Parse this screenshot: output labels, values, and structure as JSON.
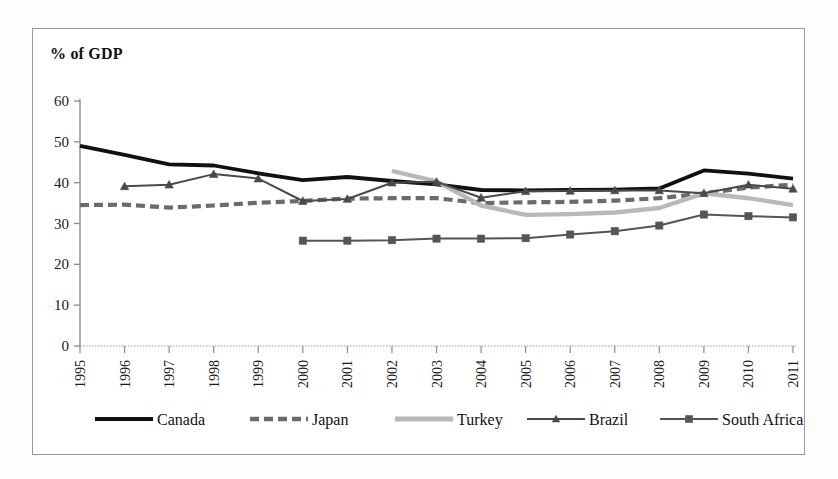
{
  "chart_data": {
    "type": "line",
    "title": "% of GDP",
    "ylabel": "% of GDP",
    "xlabel": "",
    "ylim": [
      0,
      60
    ],
    "ytick_step": 10,
    "grid": false,
    "legend_position": "bottom",
    "yticks": [
      "0",
      "10",
      "20",
      "30",
      "40",
      "50",
      "60"
    ],
    "categories": [
      "1995",
      "1996",
      "1997",
      "1998",
      "1999",
      "2000",
      "2001",
      "2002",
      "2003",
      "2004",
      "2005",
      "2006",
      "2007",
      "2008",
      "2009",
      "2010",
      "2011"
    ],
    "series": [
      {
        "name": "Canada",
        "color": "#111111",
        "style": "solid-thick",
        "marker": "none",
        "values": [
          49.0,
          46.8,
          44.5,
          44.2,
          42.3,
          40.6,
          41.4,
          40.4,
          39.6,
          38.2,
          38.1,
          38.2,
          38.3,
          38.6,
          43.0,
          42.2,
          41.0
        ]
      },
      {
        "name": "Japan",
        "color": "#6b6b6b",
        "style": "dashed-thick",
        "marker": "none",
        "values": [
          34.5,
          34.6,
          33.9,
          34.4,
          35.1,
          35.5,
          36.1,
          36.2,
          36.2,
          35.0,
          35.2,
          35.3,
          35.6,
          36.2,
          37.4,
          38.8,
          39.5
        ]
      },
      {
        "name": "Turkey",
        "color": "#b9b9b9",
        "style": "solid-thick",
        "marker": "none",
        "values": [
          null,
          null,
          null,
          null,
          null,
          null,
          null,
          42.9,
          40.3,
          34.4,
          32.1,
          32.3,
          32.7,
          33.8,
          37.4,
          36.2,
          34.5
        ]
      },
      {
        "name": "Brazil",
        "color": "#4a4a4a",
        "style": "solid-marker",
        "marker": "triangle",
        "values": [
          null,
          39.1,
          39.5,
          42.1,
          41.0,
          35.5,
          36.0,
          40.0,
          40.2,
          36.3,
          37.9,
          38.0,
          38.1,
          38.1,
          37.4,
          39.5,
          38.5
        ]
      },
      {
        "name": "South Africa",
        "color": "#555555",
        "style": "solid-marker",
        "marker": "square",
        "values": [
          null,
          null,
          null,
          null,
          null,
          25.8,
          25.8,
          25.9,
          26.3,
          26.3,
          26.4,
          27.3,
          28.1,
          29.5,
          32.2,
          31.8,
          31.5
        ]
      }
    ]
  },
  "legend": {
    "items": [
      {
        "label": "Canada"
      },
      {
        "label": "Japan"
      },
      {
        "label": "Turkey"
      },
      {
        "label": "Brazil"
      },
      {
        "label": "South Africa"
      }
    ]
  }
}
